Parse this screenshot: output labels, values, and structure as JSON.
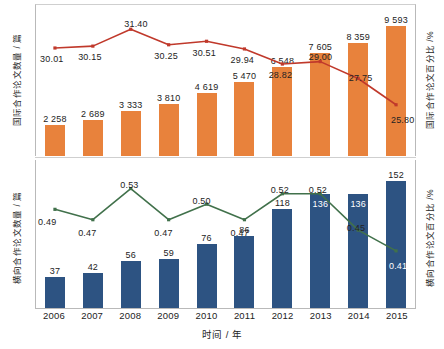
{
  "axes": {
    "x_title": "时间 / 年",
    "top_left_title": "国际合作论文数量 / 篇",
    "top_right_title": "国际合作论文百分比 /%",
    "bottom_left_title": "横向合作论文数量 / 篇",
    "bottom_right_title": "横向合作论文百分比 /%"
  },
  "colors": {
    "bar_top": "#E8823C",
    "bar_bottom": "#2D5382",
    "line_top": "#C0392B",
    "line_bottom": "#41714B",
    "axis": "#B9B9B9",
    "text": "#232323"
  },
  "years": [
    "2006",
    "2007",
    "2008",
    "2009",
    "2010",
    "2011",
    "2012",
    "2013",
    "2014",
    "2015"
  ],
  "chart_data": [
    {
      "type": "bar",
      "panel": "top",
      "title": "",
      "xlabel": "时间 / 年",
      "ylabel": "国际合作论文数量 / 篇",
      "y2label": "国际合作论文百分比 /%",
      "grid": false,
      "legend": "none",
      "categories": [
        "2006",
        "2007",
        "2008",
        "2009",
        "2010",
        "2011",
        "2012",
        "2013",
        "2014",
        "2015"
      ],
      "series": [
        {
          "name": "国际合作论文数量 / 篇",
          "kind": "bar",
          "axis": "left",
          "color": "#E8823C",
          "values": [
            2258,
            2689,
            3333,
            3810,
            4619,
            5470,
            6548,
            7605,
            8359,
            9593
          ],
          "labels": [
            "2 258",
            "2 689",
            "3 333",
            "3 810",
            "4 619",
            "5 470",
            "6 548",
            "7 605",
            "8 359",
            "9 593"
          ],
          "ylim": [
            0,
            11200
          ]
        },
        {
          "name": "国际合作论文百分比 /%",
          "kind": "line",
          "axis": "right",
          "color": "#C0392B",
          "values": [
            30.01,
            30.15,
            31.4,
            30.25,
            30.51,
            29.94,
            28.82,
            29.0,
            27.75,
            25.8
          ],
          "labels": [
            "30.01",
            "30.15",
            "31.40",
            "30.25",
            "30.51",
            "29.94",
            "28.82",
            "29.00",
            "27.75",
            "25.80"
          ],
          "ylim": [
            22.0,
            33.2
          ]
        }
      ]
    },
    {
      "type": "bar",
      "panel": "bottom",
      "title": "",
      "xlabel": "时间 / 年",
      "ylabel": "横向合作论文数量 / 篇",
      "y2label": "横向合作论文百分比 /%",
      "grid": false,
      "legend": "none",
      "categories": [
        "2006",
        "2007",
        "2008",
        "2009",
        "2010",
        "2011",
        "2012",
        "2013",
        "2014",
        "2015"
      ],
      "series": [
        {
          "name": "横向合作论文数量 / 篇",
          "kind": "bar",
          "axis": "left",
          "color": "#2D5382",
          "values": [
            37,
            42,
            56,
            59,
            76,
            86,
            118,
            136,
            136,
            152
          ],
          "labels": [
            "37",
            "42",
            "56",
            "59",
            "76",
            "86",
            "118",
            "136",
            "136",
            "152"
          ],
          "ylim": [
            0,
            178
          ]
        },
        {
          "name": "横向合作论文百分比 /%",
          "kind": "line",
          "axis": "right",
          "color": "#41714B",
          "values": [
            0.49,
            0.47,
            0.53,
            0.47,
            0.5,
            0.47,
            0.52,
            0.52,
            0.45,
            0.41
          ],
          "labels": [
            "0.49",
            "0.47",
            "0.53",
            "0.47",
            "0.50",
            "0.47",
            "0.52",
            "0.52",
            "0.45",
            "0.41"
          ],
          "ylim": [
            0.3,
            0.585
          ]
        }
      ]
    }
  ]
}
